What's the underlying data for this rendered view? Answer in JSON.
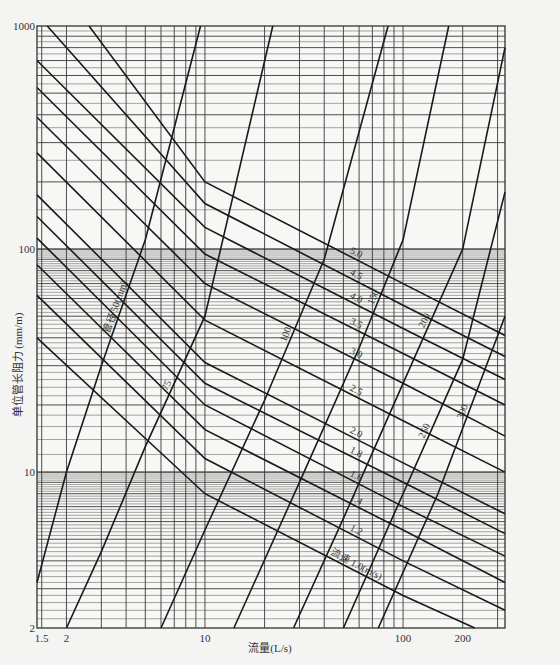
{
  "chart_data": {
    "type": "line",
    "title": "",
    "xlabel": "流量(L/s)",
    "ylabel": "单位管长阻力 (mm/m)",
    "xscale": "log",
    "yscale": "log",
    "xlim": [
      1.42,
      327
    ],
    "ylim": [
      2,
      1000
    ],
    "x_ticks": [
      1.5,
      2,
      10,
      100,
      200
    ],
    "x_tick_labels": [
      "1.5",
      "2",
      "10",
      "100",
      "200"
    ],
    "y_ticks": [
      2,
      10,
      100,
      1000
    ],
    "y_tick_labels": [
      "2",
      "10",
      "100",
      "1000"
    ],
    "grid": true,
    "legend": "none (inline curve labels)",
    "diameter_series": [
      {
        "name": "管径 50(mm)",
        "label": "管径 50(mm)",
        "points": [
          [
            1.42,
            3.2
          ],
          [
            2.0,
            10.0
          ],
          [
            3.0,
            30.0
          ],
          [
            5.0,
            110.0
          ],
          [
            9.5,
            1000.0
          ]
        ]
      },
      {
        "name": "75",
        "label": "75",
        "points": [
          [
            2.0,
            2.0
          ],
          [
            3.0,
            4.4
          ],
          [
            5.0,
            13.0
          ],
          [
            10.0,
            50.0
          ],
          [
            22.0,
            1000.0
          ]
        ]
      },
      {
        "name": "100",
        "label": "100",
        "points": [
          [
            6.0,
            2.0
          ],
          [
            10.0,
            5.5
          ],
          [
            20.0,
            21.0
          ],
          [
            40.0,
            90.0
          ],
          [
            84.0,
            1000.0
          ]
        ]
      },
      {
        "name": "150",
        "label": "150",
        "points": [
          [
            14.0,
            2.0
          ],
          [
            30.0,
            9.0
          ],
          [
            60.0,
            36.0
          ],
          [
            100.0,
            110.0
          ],
          [
            170.0,
            1000.0
          ]
        ]
      },
      {
        "name": "200",
        "label": "200",
        "points": [
          [
            28.0,
            2.0
          ],
          [
            50.0,
            6.2
          ],
          [
            100.0,
            25.0
          ],
          [
            200.0,
            100.0
          ],
          [
            327.0,
            800.0
          ]
        ]
      },
      {
        "name": "250",
        "label": "250",
        "points": [
          [
            50.0,
            2.0
          ],
          [
            100.0,
            8.0
          ],
          [
            200.0,
            32.0
          ],
          [
            327.0,
            180.0
          ]
        ]
      },
      {
        "name": "300",
        "label": "300",
        "points": [
          [
            75.0,
            2.0
          ],
          [
            150.0,
            8.0
          ],
          [
            327.0,
            50.0
          ]
        ]
      }
    ],
    "velocity_series": [
      {
        "name": "流速 1.0(m/s)",
        "label": "流速 1.0(m/s)",
        "points": [
          [
            1.42,
            40.0
          ],
          [
            10.0,
            8.0
          ],
          [
            100.0,
            2.8
          ],
          [
            230.0,
            2.0
          ]
        ]
      },
      {
        "name": "1.2",
        "label": "1.2",
        "points": [
          [
            1.42,
            62.0
          ],
          [
            10.0,
            11.5
          ],
          [
            100.0,
            4.0
          ],
          [
            327.0,
            2.4
          ]
        ]
      },
      {
        "name": "1.4",
        "label": "1.4",
        "points": [
          [
            1.42,
            85.0
          ],
          [
            10.0,
            15.5
          ],
          [
            100.0,
            5.5
          ],
          [
            327.0,
            3.2
          ]
        ]
      },
      {
        "name": "1.6",
        "label": "1.6",
        "points": [
          [
            1.42,
            112.0
          ],
          [
            10.0,
            20.0
          ],
          [
            100.0,
            7.0
          ],
          [
            327.0,
            4.2
          ]
        ]
      },
      {
        "name": "1.8",
        "label": "1.8",
        "points": [
          [
            1.42,
            140.0
          ],
          [
            10.0,
            25.0
          ],
          [
            100.0,
            9.0
          ],
          [
            327.0,
            5.3
          ]
        ]
      },
      {
        "name": "2.0",
        "label": "2.0",
        "points": [
          [
            1.42,
            175.0
          ],
          [
            10.0,
            31.0
          ],
          [
            100.0,
            11.0
          ],
          [
            327.0,
            6.5
          ]
        ]
      },
      {
        "name": "2.5",
        "label": "2.5",
        "points": [
          [
            1.42,
            270.0
          ],
          [
            10.0,
            48.0
          ],
          [
            100.0,
            17.0
          ],
          [
            327.0,
            10.0
          ]
        ]
      },
      {
        "name": "3.0",
        "label": "3.0",
        "points": [
          [
            1.42,
            390.0
          ],
          [
            10.0,
            70.0
          ],
          [
            100.0,
            25.0
          ],
          [
            327.0,
            14.5
          ]
        ]
      },
      {
        "name": "3.5",
        "label": "3.5",
        "points": [
          [
            1.42,
            530.0
          ],
          [
            10.0,
            95.0
          ],
          [
            100.0,
            34.0
          ],
          [
            327.0,
            20.0
          ]
        ]
      },
      {
        "name": "4.0",
        "label": "4.0",
        "points": [
          [
            1.42,
            700.0
          ],
          [
            10.0,
            125.0
          ],
          [
            100.0,
            44.0
          ],
          [
            327.0,
            26.0
          ]
        ]
      },
      {
        "name": "4.5",
        "label": "4.5",
        "points": [
          [
            1.6,
            1000.0
          ],
          [
            10.0,
            160.0
          ],
          [
            100.0,
            56.0
          ],
          [
            327.0,
            33.0
          ]
        ]
      },
      {
        "name": "5.0",
        "label": "5.0",
        "points": [
          [
            2.6,
            1000.0
          ],
          [
            10.0,
            200.0
          ],
          [
            100.0,
            70.0
          ],
          [
            327.0,
            41.0
          ]
        ]
      }
    ]
  },
  "axes": {
    "x_title": "流量(L/s)",
    "y_title": "单位管长阻力 (mm/m)",
    "x_ticks": [
      {
        "label": "1.5",
        "value": 1.5
      },
      {
        "label": "2",
        "value": 2
      },
      {
        "label": "10",
        "value": 10
      },
      {
        "label": "100",
        "value": 100
      },
      {
        "label": "200",
        "value": 200
      }
    ],
    "y_ticks": [
      {
        "label": "1000",
        "value": 1000
      },
      {
        "label": "100",
        "value": 100
      },
      {
        "label": "10",
        "value": 10
      },
      {
        "label": "2",
        "value": 2
      }
    ]
  },
  "colors": {
    "background": "#f4f4f2",
    "grid": "#3a3a3a",
    "curve": "#1a1a1a",
    "text": "#333333"
  }
}
